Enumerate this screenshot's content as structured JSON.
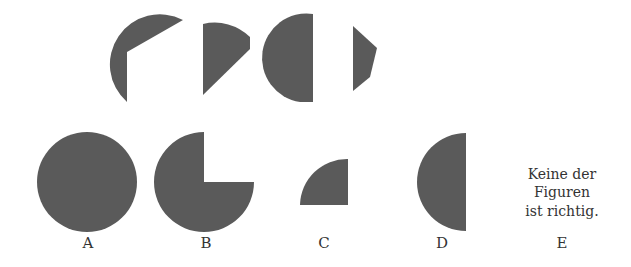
{
  "puzzle": {
    "pieces": [
      {
        "id": "piece-1",
        "description": "circular sector with wedge cut"
      },
      {
        "id": "piece-2",
        "description": "quarter-like sector"
      },
      {
        "id": "piece-3",
        "description": "left half disk"
      },
      {
        "id": "piece-4",
        "description": "small polygon segment"
      }
    ],
    "fill_color": "#5a5a5a"
  },
  "options": [
    {
      "label": "A",
      "shape": "full circle"
    },
    {
      "label": "B",
      "shape": "three-quarter circle"
    },
    {
      "label": "C",
      "shape": "quarter circle"
    },
    {
      "label": "D",
      "shape": "half circle"
    },
    {
      "label": "E",
      "text_lines": [
        "Keine der",
        "Figuren",
        "ist richtig."
      ]
    }
  ]
}
